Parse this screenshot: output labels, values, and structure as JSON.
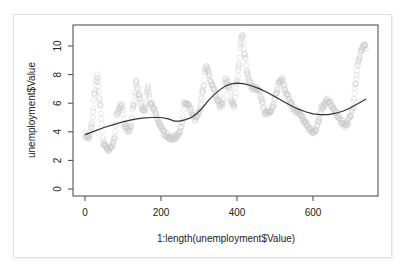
{
  "chart_data": {
    "type": "scatter",
    "title": "",
    "xlabel": "1:length(unemployment$Value)",
    "ylabel": "unemployment$Value",
    "xlim": [
      -20,
      770
    ],
    "ylim": [
      -0.5,
      11.2
    ],
    "x_ticks": [
      0,
      200,
      400,
      600
    ],
    "y_ticks": [
      0,
      2,
      4,
      6,
      8,
      10
    ],
    "grid": false,
    "legend": null,
    "series": [
      {
        "name": "unemployment$Value",
        "kind": "points",
        "marker": "open-circle",
        "color": "#c8c8c8",
        "anchor_x": [
          0,
          10,
          18,
          25,
          32,
          40,
          48,
          55,
          62,
          70,
          78,
          85,
          95,
          105,
          112,
          120,
          128,
          135,
          142,
          150,
          158,
          165,
          172,
          180,
          188,
          195,
          205,
          215,
          225,
          235,
          245,
          255,
          262,
          270,
          278,
          285,
          292,
          300,
          310,
          318,
          325,
          332,
          340,
          348,
          355,
          362,
          370,
          378,
          385,
          392,
          400,
          405,
          410,
          415,
          420,
          428,
          435,
          442,
          450,
          458,
          465,
          472,
          480,
          488,
          495,
          502,
          510,
          518,
          525,
          532,
          540,
          548,
          555,
          562,
          570,
          578,
          585,
          592,
          600,
          608,
          615,
          622,
          630,
          638,
          645,
          652,
          660,
          668,
          675,
          682,
          690,
          698,
          705,
          712,
          720,
          728,
          735,
          740
        ],
        "anchor_y": [
          3.8,
          3.5,
          4.5,
          6.6,
          7.9,
          5.8,
          3.2,
          3.0,
          2.7,
          2.9,
          3.6,
          5.4,
          5.8,
          4.5,
          4.1,
          4.3,
          5.9,
          7.5,
          6.5,
          5.6,
          5.5,
          7.1,
          6.0,
          5.7,
          5.1,
          4.6,
          4.0,
          3.8,
          3.5,
          3.6,
          3.8,
          4.5,
          6.0,
          5.9,
          5.5,
          5.0,
          4.9,
          5.3,
          6.8,
          8.6,
          8.2,
          7.4,
          6.9,
          6.3,
          5.8,
          5.9,
          7.6,
          7.3,
          6.2,
          5.9,
          7.5,
          8.5,
          10.4,
          10.8,
          9.5,
          8.0,
          7.3,
          7.1,
          7.0,
          6.8,
          6.2,
          5.4,
          5.3,
          5.4,
          5.8,
          6.6,
          7.4,
          7.8,
          7.1,
          6.6,
          6.0,
          5.7,
          5.4,
          5.4,
          5.0,
          4.7,
          4.4,
          4.2,
          4.0,
          4.1,
          4.7,
          5.7,
          5.9,
          6.2,
          6.0,
          5.7,
          5.3,
          5.0,
          4.7,
          4.5,
          4.6,
          5.0,
          5.8,
          7.4,
          9.0,
          9.7,
          10.0,
          9.9
        ],
        "n_points": 740
      },
      {
        "name": "smooth",
        "kind": "line",
        "color": "#333333",
        "x": [
          0,
          25,
          50,
          75,
          100,
          125,
          150,
          175,
          200,
          220,
          235,
          250,
          265,
          280,
          295,
          310,
          325,
          340,
          355,
          370,
          385,
          400,
          420,
          440,
          460,
          480,
          500,
          520,
          540,
          560,
          580,
          600,
          620,
          640,
          660,
          680,
          700,
          720,
          740
        ],
        "y": [
          3.8,
          4.05,
          4.3,
          4.5,
          4.7,
          4.85,
          4.95,
          5.0,
          5.0,
          4.9,
          4.75,
          4.75,
          4.85,
          5.0,
          5.3,
          5.7,
          6.2,
          6.6,
          6.95,
          7.2,
          7.35,
          7.4,
          7.35,
          7.2,
          7.0,
          6.75,
          6.45,
          6.15,
          5.85,
          5.6,
          5.4,
          5.25,
          5.2,
          5.2,
          5.3,
          5.45,
          5.7,
          6.0,
          6.3
        ]
      }
    ]
  },
  "axes": {
    "x_tick_labels": [
      "0",
      "200",
      "400",
      "600"
    ],
    "y_tick_labels": [
      "0",
      "2",
      "4",
      "6",
      "8",
      "10"
    ],
    "xlabel": "1:length(unemployment$Value)",
    "ylabel": "unemployment$Value"
  }
}
